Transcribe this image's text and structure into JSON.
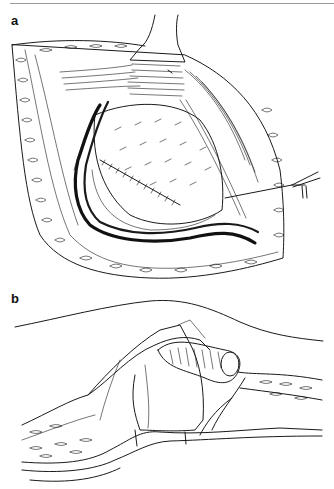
{
  "figure": {
    "panels": [
      {
        "label": "a",
        "description": "Surgical illustration: open incision with retractor, exposed organ and dissected vessel pedicle with suture"
      },
      {
        "label": "b",
        "description": "Surgical illustration: cross-section showing tubular structure brought through layered tissue flap"
      }
    ]
  }
}
